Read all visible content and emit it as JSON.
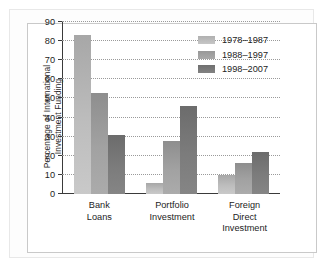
{
  "chart_data": {
    "type": "bar",
    "title": "",
    "xlabel": "",
    "ylabel": "Percentage of International Investment Funding",
    "ylabel_lines": [
      "Percentage of International",
      "Investment Funding"
    ],
    "categories": [
      "Bank Loans",
      "Portfolio Investment",
      "Foreign Direct Investment"
    ],
    "category_lines": [
      [
        "Bank",
        "Loans"
      ],
      [
        "Portfolio",
        "Investment"
      ],
      [
        "Foreign",
        "Direct",
        "Investment"
      ]
    ],
    "series": [
      {
        "name": "1978–1987",
        "values": [
          83,
          6,
          10
        ],
        "color": "#bdbdbd"
      },
      {
        "name": "1988–1997",
        "values": [
          53,
          28,
          16
        ],
        "color": "#a2a2a2"
      },
      {
        "name": "1998–2007",
        "values": [
          31,
          46,
          22
        ],
        "color": "#7c7c7c"
      }
    ],
    "ylim": [
      0,
      90
    ],
    "yticks": [
      0,
      10,
      20,
      30,
      40,
      50,
      60,
      70,
      80,
      90
    ],
    "ytick_labels": [
      "0",
      "10",
      "20",
      "30",
      "40",
      "50",
      "60",
      "70",
      "80",
      "90"
    ],
    "grid": true,
    "grid_style": "dotted",
    "legend_position": "top-right"
  },
  "legend": {
    "entries": [
      "1978–1987",
      "1988–1997",
      "1998–2007"
    ]
  }
}
